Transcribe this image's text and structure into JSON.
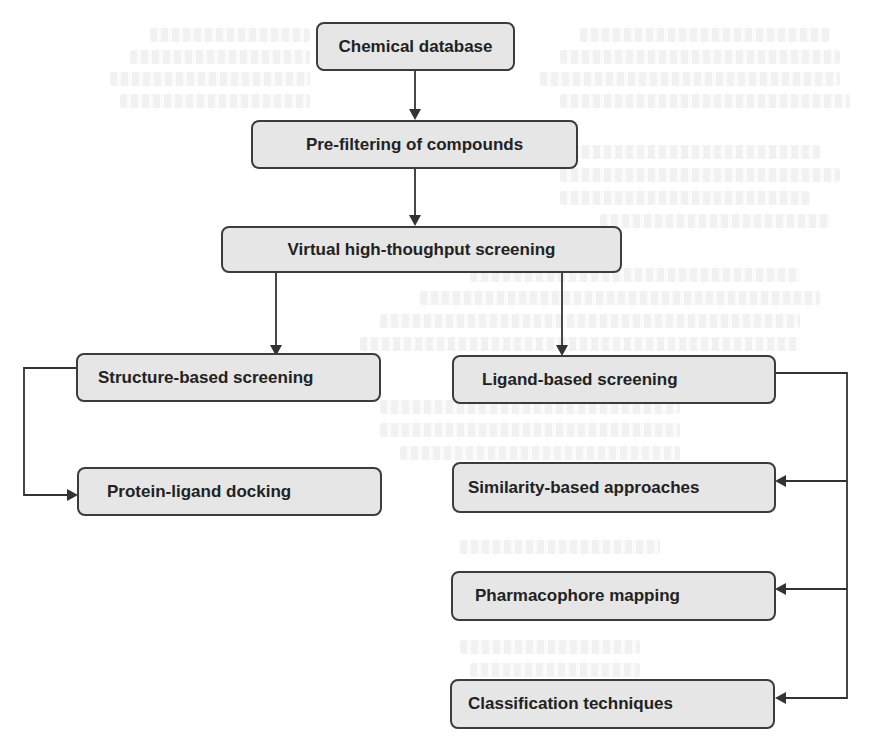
{
  "diagram": {
    "type": "flowchart",
    "nodes": {
      "chemical_database": "Chemical database",
      "pre_filtering": "Pre-filtering of compounds",
      "virtual_hts": "Virtual high-thoughput screening",
      "structure_based": "Structure-based screening",
      "protein_ligand_docking": "Protein-ligand docking",
      "ligand_based": "Ligand-based screening",
      "similarity_based": "Similarity-based approaches",
      "pharmacophore_mapping": "Pharmacophore mapping",
      "classification_techniques": "Classification techniques"
    },
    "edges": [
      {
        "from": "chemical_database",
        "to": "pre_filtering"
      },
      {
        "from": "pre_filtering",
        "to": "virtual_hts"
      },
      {
        "from": "virtual_hts",
        "to": "structure_based"
      },
      {
        "from": "virtual_hts",
        "to": "ligand_based"
      },
      {
        "from": "structure_based",
        "to": "protein_ligand_docking"
      },
      {
        "from": "ligand_based",
        "to": "similarity_based"
      },
      {
        "from": "ligand_based",
        "to": "pharmacophore_mapping"
      },
      {
        "from": "ligand_based",
        "to": "classification_techniques"
      }
    ],
    "colors": {
      "box_fill": "#e6e6e6",
      "box_border": "#3c3c3c",
      "text": "#222222",
      "connector": "#333333"
    }
  }
}
